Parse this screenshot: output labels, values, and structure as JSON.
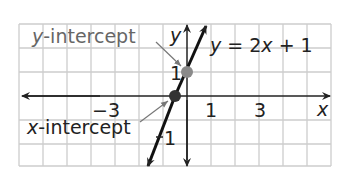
{
  "graph": {
    "equation": "y = 2x + 1",
    "equation_parts": {
      "y": "y",
      "eq": " = 2",
      "x": "x",
      "rest": " + 1"
    },
    "axis_x_label": "x",
    "axis_y_label": "y",
    "tick_labels": {
      "x_neg3": "−3",
      "x_1": "1",
      "x_3": "3",
      "y_1": "1",
      "y_neg1": "1"
    },
    "annotations": {
      "y_intercept": {
        "var": "y",
        "rest": "-intercept"
      },
      "x_intercept": {
        "var": "x",
        "rest": "-intercept"
      }
    },
    "points": {
      "y_intercept": [
        0,
        1
      ],
      "x_intercept": [
        -0.5,
        0
      ]
    },
    "colors": {
      "grid": "#cccccc",
      "axis": "#222222",
      "line": "#111111",
      "point_y": "#8a8a8a",
      "point_x": "#333333",
      "label_gray": "#666666"
    }
  }
}
